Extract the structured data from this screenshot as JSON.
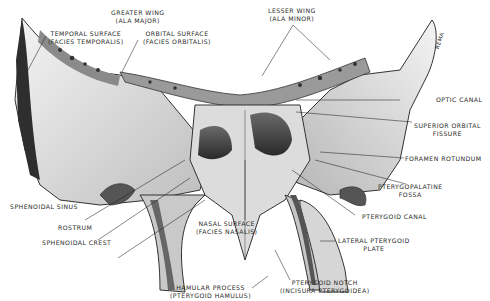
{
  "diagram": {
    "bone_tag": "REMA",
    "labels": {
      "greater_wing": [
        "GREATER WING",
        "(ALA MAJOR)"
      ],
      "temporal_surface": [
        "TEMPORAL SURFACE",
        "(FACIES TEMPORALIS)"
      ],
      "orbital_surface": [
        "ORBITAL SURFACE",
        "(FACIES ORBITALIS)"
      ],
      "lesser_wing": [
        "LESSER WING",
        "(ALA MINOR)"
      ],
      "optic_canal": [
        "OPTIC CANAL"
      ],
      "superior_orbital_fissure": [
        "SUPERIOR ORBITAL",
        "FISSURE"
      ],
      "foramen_rotundum": [
        "FORAMEN ROTUNDUM"
      ],
      "pterygopalatine_fossa": [
        "PTERYGOPALATINE",
        "FOSSA"
      ],
      "pterygoid_canal": [
        "PTERYGOID CANAL"
      ],
      "lateral_pterygoid_plate": [
        "LATERAL PTERYGOID",
        "PLATE"
      ],
      "pterygoid_notch": [
        "PTERYGOID NOTCH",
        "(INCISURA PTERYGOIDEA)"
      ],
      "hamular_process": [
        "HAMULAR PROCESS",
        "(PTERYGOID HAMULUS)"
      ],
      "nasal_surface": [
        "NASAL SURFACE",
        "(FACIES NASALIS)"
      ],
      "sphenoidal_sinus": [
        "SPHENOIDAL SINUS"
      ],
      "rostrum": [
        "ROSTRUM"
      ],
      "sphenoidal_crest": [
        "SPHENOIDAL CREST"
      ]
    }
  }
}
